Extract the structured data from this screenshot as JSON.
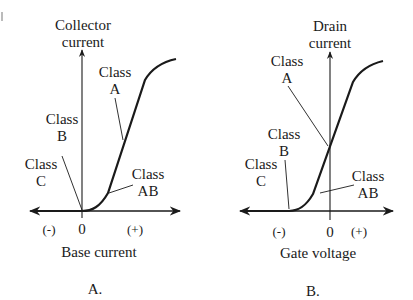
{
  "panels": [
    {
      "id": "A",
      "caption": "A.",
      "y_axis_label_line1": "Collector",
      "y_axis_label_line2": "current",
      "x_axis_label": "Base current",
      "x_ticks": {
        "neg": "(-)",
        "zero": "0",
        "pos": "(+)"
      },
      "classes": {
        "a": {
          "line1": "Class",
          "line2": "A"
        },
        "b": {
          "line1": "Class",
          "line2": "B"
        },
        "ab": {
          "line1": "Class",
          "line2": "AB"
        },
        "c": {
          "line1": "Class",
          "line2": "C"
        }
      }
    },
    {
      "id": "B",
      "caption": "B.",
      "y_axis_label_line1": "Drain",
      "y_axis_label_line2": "current",
      "x_axis_label": "Gate voltage",
      "x_ticks": {
        "neg": "(-)",
        "zero": "0",
        "pos": "(+)"
      },
      "classes": {
        "a": {
          "line1": "Class",
          "line2": "A"
        },
        "b": {
          "line1": "Class",
          "line2": "B"
        },
        "ab": {
          "line1": "Class",
          "line2": "AB"
        },
        "c": {
          "line1": "Class",
          "line2": "C"
        }
      }
    }
  ],
  "colors": {
    "ink": "#1a1a1a",
    "background": "#ffffff"
  }
}
